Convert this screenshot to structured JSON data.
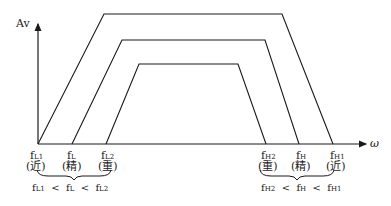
{
  "axes": {
    "y_label": "Av",
    "x_label": "ω"
  },
  "curves": [
    {
      "name": "outer",
      "points": [
        [
          38,
          144
        ],
        [
          104,
          14
        ],
        [
          282,
          14
        ],
        [
          333,
          144
        ]
      ]
    },
    {
      "name": "middle",
      "points": [
        [
          72,
          144
        ],
        [
          122,
          40
        ],
        [
          265,
          40
        ],
        [
          299,
          144
        ]
      ]
    },
    {
      "name": "inner",
      "points": [
        [
          106,
          144
        ],
        [
          139,
          64
        ],
        [
          238,
          64
        ],
        [
          266,
          144
        ]
      ]
    }
  ],
  "low_labels": [
    {
      "f": "f",
      "sub": "L1",
      "tag": "(近)"
    },
    {
      "f": "f",
      "sub": "L",
      "tag": "(精)"
    },
    {
      "f": "f",
      "sub": "L2",
      "tag": "(重)"
    }
  ],
  "high_labels": [
    {
      "f": "f",
      "sub": "H2",
      "tag": "(重)"
    },
    {
      "f": "f",
      "sub": "H",
      "tag": "(精)"
    },
    {
      "f": "f",
      "sub": "H1",
      "tag": "(近)"
    }
  ],
  "low_inequality": {
    "a": "f",
    "a_sub": "L1",
    "op1": "<",
    "b": "f",
    "b_sub": "L",
    "op2": "<",
    "c": "f",
    "c_sub": "L2"
  },
  "high_inequality": {
    "a": "f",
    "a_sub": "H2",
    "op1": "<",
    "b": "f",
    "b_sub": "H",
    "op2": "<",
    "c": "f",
    "c_sub": "H1"
  }
}
